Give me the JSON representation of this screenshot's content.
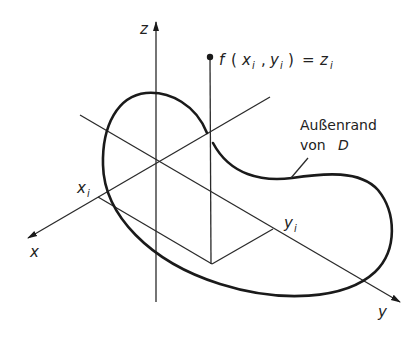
{
  "diagram": {
    "type": "3d-coordinate-sketch",
    "axes": {
      "x": {
        "label": "x"
      },
      "y": {
        "label": "y"
      },
      "z": {
        "label": "z"
      }
    },
    "point": {
      "label_f": "f",
      "label_open": "(",
      "label_x": "x",
      "label_xsub": "i",
      "label_comma": ",",
      "label_y": "y",
      "label_ysub": "i",
      "label_close": ")",
      "label_eq": "=",
      "label_z": "z",
      "label_zsub": "i"
    },
    "projections": {
      "xi_label": "x",
      "xi_sub": "i",
      "yi_label": "y",
      "yi_sub": "i"
    },
    "boundary": {
      "label_line1": "Außenrand",
      "label_line2_prefix": "von",
      "label_line2_symbol": "D"
    }
  }
}
